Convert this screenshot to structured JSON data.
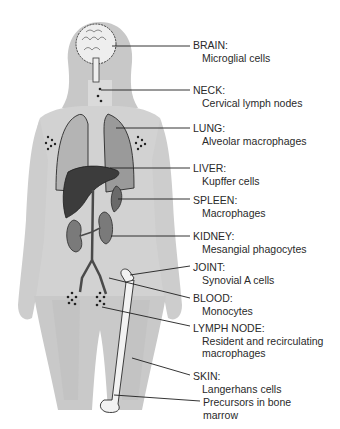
{
  "figure": {
    "colors": {
      "body": "#d2d2d2",
      "body_shadow": "#c2c2c2",
      "organ_light": "#b8b8b8",
      "organ_mid": "#8c8c8c",
      "liver": "#3c3c3c",
      "line": "#1e1e1e",
      "text": "#2a2a2a"
    },
    "labels": [
      {
        "title": "BRAIN:",
        "sub": [
          "Microglial cells"
        ]
      },
      {
        "title": "NECK:",
        "sub": [
          "Cervical lymph nodes"
        ]
      },
      {
        "title": "LUNG:",
        "sub": [
          "Alveolar macrophages"
        ]
      },
      {
        "title": "LIVER:",
        "sub": [
          "Kupffer cells"
        ]
      },
      {
        "title": "SPLEEN:",
        "sub": [
          "Macrophages"
        ]
      },
      {
        "title": "KIDNEY:",
        "sub": [
          "Mesangial phagocytes"
        ]
      },
      {
        "title": "JOINT:",
        "sub": [
          "Synovial A cells"
        ]
      },
      {
        "title": "BLOOD:",
        "sub": [
          "Monocytes"
        ]
      },
      {
        "title": "LYMPH NODE:",
        "sub": [
          "Resident and recirculating",
          "macrophages"
        ]
      },
      {
        "title": "SKIN:",
        "sub": [
          "Langerhans cells"
        ]
      },
      {
        "title": "",
        "sub": [
          "Precursors in bone",
          "marrow"
        ]
      }
    ]
  }
}
